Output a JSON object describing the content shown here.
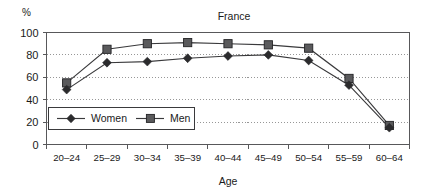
{
  "chart_data": {
    "type": "line",
    "title": "France",
    "xlabel": "Age",
    "ylabel": "%",
    "categories": [
      "20–24",
      "25–29",
      "30–34",
      "35–39",
      "40–44",
      "45–49",
      "50–54",
      "55–59",
      "60–64"
    ],
    "series": [
      {
        "name": "Women",
        "marker": "diamond",
        "color": "#2b2b2d",
        "values": [
          49,
          73,
          74,
          77,
          79,
          80,
          75,
          53,
          15
        ]
      },
      {
        "name": "Men",
        "marker": "square",
        "color": "#5a5a5c",
        "values": [
          55,
          85,
          90,
          91,
          90,
          89,
          86,
          59,
          17
        ]
      }
    ],
    "ylim": [
      0,
      100
    ],
    "yticks": [
      0,
      20,
      40,
      60,
      80,
      100
    ],
    "ytick_labels": [
      "0",
      "20",
      "40",
      "60",
      "80",
      "100"
    ],
    "grid": "horizontal-dotted",
    "legend_position": "inside-lower-left"
  },
  "legend": {
    "entries": [
      {
        "label": "Women",
        "marker": "diamond-icon"
      },
      {
        "label": "Men",
        "marker": "square-icon"
      }
    ]
  },
  "axes": {
    "y_axis_unit": "%",
    "x_axis_title": "Age"
  }
}
